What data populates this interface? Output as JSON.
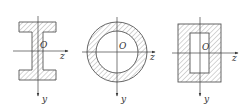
{
  "figure": {
    "colors": {
      "stroke": "#555555",
      "hatch": "#888888",
      "background": "#ffffff"
    },
    "sections": [
      {
        "id": "i-beam",
        "shape": "I-section",
        "origin_label": "O",
        "z_label": "z",
        "y_label": "y"
      },
      {
        "id": "hollow-circle",
        "shape": "annulus",
        "origin_label": "O",
        "z_label": "z",
        "y_label": "y"
      },
      {
        "id": "hollow-rectangle",
        "shape": "rectangular tube",
        "origin_label": "O",
        "z_label": "z",
        "y_label": "y"
      }
    ]
  }
}
